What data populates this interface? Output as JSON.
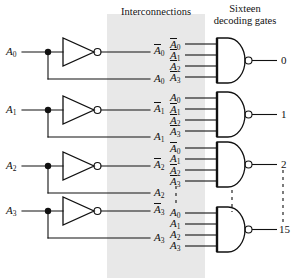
{
  "figure": {
    "width": 303,
    "height": 278,
    "background": "#ffffff",
    "ink": "#111111",
    "band_color": "#e8e8e8"
  },
  "headers": {
    "interconnections": "Interconnections",
    "decoding_gates": "Sixteen decoding gates"
  },
  "inverter_section": {
    "rows": [
      {
        "input": "A",
        "input_sub": "0",
        "out_comp": "A",
        "out_comp_sub": "0",
        "out_true": "A",
        "out_true_sub": "0"
      },
      {
        "input": "A",
        "input_sub": "1",
        "out_comp": "A",
        "out_comp_sub": "1",
        "out_true": "A",
        "out_true_sub": "1"
      },
      {
        "input": "A",
        "input_sub": "2",
        "out_comp": "A",
        "out_comp_sub": "2",
        "out_true": "A",
        "out_true_sub": "2"
      },
      {
        "input": "A",
        "input_sub": "3",
        "out_comp": "A",
        "out_comp_sub": "3",
        "out_true": "A",
        "out_true_sub": "3"
      }
    ],
    "input_labels": [
      "A0",
      "A1",
      "A2",
      "A3"
    ],
    "complement_labels": [
      "A0-bar",
      "A1-bar",
      "A2-bar",
      "A3-bar"
    ],
    "true_labels": [
      "A0",
      "A1",
      "A2",
      "A3"
    ],
    "gate_type": "inverter",
    "count": 4
  },
  "decoder_gates": {
    "gate_type": "NAND",
    "inputs_per_gate": 4,
    "total_gates": 16,
    "shown_gates": [
      {
        "output": "0",
        "inputs": [
          {
            "letter": "A",
            "sub": "0",
            "complemented": true
          },
          {
            "letter": "A",
            "sub": "1",
            "complemented": true
          },
          {
            "letter": "A",
            "sub": "2",
            "complemented": true
          },
          {
            "letter": "A",
            "sub": "3",
            "complemented": true
          }
        ]
      },
      {
        "output": "1",
        "inputs": [
          {
            "letter": "A",
            "sub": "0",
            "complemented": false
          },
          {
            "letter": "A",
            "sub": "1",
            "complemented": true
          },
          {
            "letter": "A",
            "sub": "2",
            "complemented": true
          },
          {
            "letter": "A",
            "sub": "3",
            "complemented": true
          }
        ]
      },
      {
        "output": "2",
        "inputs": [
          {
            "letter": "A",
            "sub": "0",
            "complemented": true
          },
          {
            "letter": "A",
            "sub": "1",
            "complemented": false
          },
          {
            "letter": "A",
            "sub": "2",
            "complemented": true
          },
          {
            "letter": "A",
            "sub": "3",
            "complemented": true
          }
        ]
      },
      {
        "output": "15",
        "inputs": [
          {
            "letter": "A",
            "sub": "0",
            "complemented": false
          },
          {
            "letter": "A",
            "sub": "1",
            "complemented": false
          },
          {
            "letter": "A",
            "sub": "2",
            "complemented": false
          },
          {
            "letter": "A",
            "sub": "3",
            "complemented": false
          }
        ]
      }
    ],
    "ellipsis": "vertical dashed lines indicating omitted gates 3 through 14"
  }
}
